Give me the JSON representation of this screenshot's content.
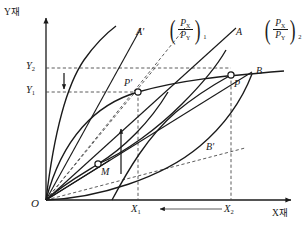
{
  "figure": {
    "background_color": "#ffffff",
    "line_color": "#1a1a1a",
    "width": 302,
    "height": 235
  },
  "axes": {
    "y_label": "Y재",
    "x_label": "X재",
    "origin_label": "O"
  },
  "ticks": {
    "y": [
      {
        "id": "Y1",
        "base": "Y",
        "sub": "1",
        "value_px_y": 92
      },
      {
        "id": "Y2",
        "base": "Y",
        "sub": "2",
        "value_px_y": 68
      }
    ],
    "x": [
      {
        "id": "X1",
        "base": "X",
        "sub": "1",
        "value_px_x": 138
      },
      {
        "id": "X2",
        "base": "X",
        "sub": "2",
        "value_px_x": 231
      }
    ]
  },
  "points": [
    {
      "name": "P",
      "label": "P",
      "x": 231,
      "y": 75
    },
    {
      "name": "P-prime",
      "label": "P'",
      "x": 138,
      "y": 92
    },
    {
      "name": "M",
      "label": "M",
      "x": 98,
      "y": 164
    }
  ],
  "curve_labels": [
    {
      "name": "A",
      "label": "A",
      "x": 239,
      "y": 33
    },
    {
      "name": "A-prime",
      "label": "A'",
      "x": 139,
      "y": 33
    },
    {
      "name": "B",
      "label": "B",
      "x": 259,
      "y": 72
    },
    {
      "name": "B-prime",
      "label": "B'",
      "x": 209,
      "y": 148
    }
  ],
  "price_ratios": [
    {
      "name": "price-ratio-1",
      "numerator": "P",
      "numerator_sub": "X",
      "denominator": "P",
      "denominator_sub": "Y",
      "index": "1"
    },
    {
      "name": "price-ratio-2",
      "numerator": "P",
      "numerator_sub": "X",
      "denominator": "P",
      "denominator_sub": "Y",
      "index": "2"
    }
  ],
  "arrows": [
    {
      "name": "y-decrease-arrow",
      "direction": "down",
      "from": [
        64,
        74
      ],
      "to": [
        64,
        90
      ]
    },
    {
      "name": "x-decrease-arrow",
      "direction": "left",
      "from": [
        222,
        209
      ],
      "to": [
        160,
        209
      ]
    },
    {
      "name": "vertical-up-arrow",
      "direction": "up",
      "from": [
        121,
        172
      ],
      "to": [
        121,
        130
      ]
    }
  ]
}
